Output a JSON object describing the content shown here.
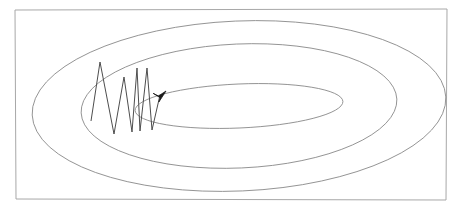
{
  "figure": {
    "title": "",
    "width": 465,
    "height": 213,
    "background_color": "#ffffff"
  },
  "frame": {
    "name": "outer-border-rectangle",
    "stroke_color": "#a8a8a8",
    "stroke_width": 1,
    "corners": {
      "top_left": [
        15,
        10
      ],
      "top_right": [
        447,
        9
      ],
      "bottom_right": [
        446,
        200
      ],
      "bottom_left": [
        16,
        199
      ]
    }
  },
  "chart_data": {
    "type": "scatter",
    "title": "",
    "xlabel": "",
    "ylabel": "",
    "grid": false,
    "legend": null,
    "contours": {
      "count": 3,
      "stroke_color": "#8a8a8a",
      "stroke_width": 0.9,
      "center": [
        239,
        106
      ],
      "rotation_deg": -2.5,
      "levels": [
        {
          "label": "outer-contour",
          "rx": 207,
          "ry": 85
        },
        {
          "label": "middle-contour",
          "rx": 158,
          "ry": 62
        },
        {
          "label": "inner-contour",
          "rx": 104,
          "ry": 22
        }
      ]
    },
    "descent_path": {
      "stroke_color": "#4d4d4d",
      "stroke_width": 1.0,
      "points": [
        [
          91,
          121
        ],
        [
          100,
          62
        ],
        [
          114,
          134
        ],
        [
          124,
          77
        ],
        [
          132,
          132
        ],
        [
          137,
          68
        ],
        [
          140,
          131
        ],
        [
          147,
          68
        ],
        [
          152,
          130
        ],
        [
          160,
          95
        ]
      ],
      "arrowhead": {
        "name": "arrow-head",
        "tip": [
          166,
          91
        ],
        "fill_color": "#1a1a1a",
        "direction": "up-right"
      }
    }
  }
}
